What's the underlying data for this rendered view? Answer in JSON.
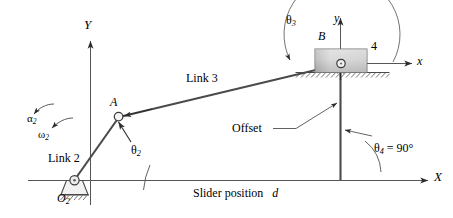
{
  "figure": {
    "type": "kinematic-diagram",
    "background_color": "#ffffff",
    "line_color": "#3a3a3a",
    "text_color": "#000000",
    "slider_fill_light": "#e6e6e6",
    "slider_fill_dark": "#9a9a9a"
  },
  "axes": {
    "global_x_label": "X",
    "global_y_label": "Y",
    "local_x_label": "x",
    "local_y_label": "y"
  },
  "points": {
    "pivot_label": "O",
    "pivot_sub": "2",
    "joint_a_label": "A",
    "joint_b_label": "B"
  },
  "links": {
    "link2_label": "Link 2",
    "link3_label": "Link 3",
    "link4_label": "4"
  },
  "angles": {
    "theta2_sym": "θ",
    "theta2_sub": "2",
    "theta3_sym": "θ",
    "theta3_sub": "3",
    "theta4_text": "= 90°",
    "theta4_sym": "θ",
    "theta4_sub": "4"
  },
  "motion": {
    "alpha2_sym": "α",
    "alpha2_sub": "2",
    "omega2_sym": "ω",
    "omega2_sub": "2"
  },
  "annotations": {
    "offset_label": "Offset",
    "slider_position_label": "Slider position",
    "slider_position_var": "d"
  }
}
